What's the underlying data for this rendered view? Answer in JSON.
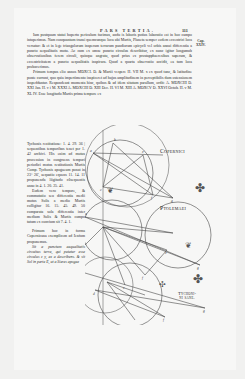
{
  "page": {
    "running_header": "PARS TERTIA.",
    "page_number": "111",
    "marginal_note": [
      "Cap.",
      "XXIV."
    ],
    "main_paragraphs": [
      "Iam postquam statui hupertu periculum facimus, andu is laboris potius laboratio est in hoc campo intuperimus. Nam conquantum transi quemcunque loca ubi Martis, Planeta semper eodem eccentrici loca versatur: & et in lege triangulorum insperam terrarum pandiorum epicycli vel orbis annui differentia a puncto aequalitatis motu. Ac cum ex omne puncto circulus describitur, ex nunc igitur longumub observationibus ferem circuli, quinque angratu, quod prius ex prostapphaeresibus superam, & eccentricitatem a puncto aequalitatis inspirara. Quod a quarta observatio accidit, ea tum loca probaverimus.",
      "Primum tempus elio annos MDXCI. D. & Martii vespere H. VII M. x ex quod tunc, & latitudine ponte currunt, quo quia impertimento inspiceret ad hujus amplitudinem in perceptibilis dum ostensionem inspeddantur. Respondeant momenta hinc, quibus & ad idem situtum parallum, ordit: A. MDXCIII D. XXI Jan. H. v i M. XXXI  A. MDXCIII D. XIII Dec. H. VI M. XIII  A. MDXCV D. XXVI Octob. H. v M. XL IV. Esse longitudo Martis prima tempore ex"
    ],
    "column_paragraphs": [
      "Tychonis restitutione: 1. 4. 29. 36 | sequentibus temporibus tenet per 1. 42 archivi. His enim ad motus procession in congruens tempori periodici motus restitutionis Martis Comp. Tychonis apogaeum ponat in 23° 26', aequatio equens 11. 14. 11 proponenda lõgitudo cŏsequentis anno in 4. 1. 20. 25. 41.",
      "Eodem vero tempore, & commutatio seu differentia medii motus Solis a medio Martis colligitur 16. 15. 45. 49. 50 comparata sola differentia inter medium Solis & Martis compu tatum ex convium sit 7. 4. 1.",
      "Primum hoc in forma Copernicana exemplicem ad Ienfum proponemus.",
      "Sit a punctum aequalitatis circuitus terra, qui putatur esse circulus z y, ex a describens. & sit Sol in parte E, ut a Sieres apogee"
    ]
  },
  "diagram": {
    "labels": {
      "copernicus": "Copernici",
      "ptolemy": "Ptolemaei",
      "tycho": [
        "Tychoni-",
        "ni sane."
      ]
    }
  },
  "colors": {
    "paper": "#f7f7f6",
    "ink": "#2a2a2a",
    "line": "#4a4a4a"
  }
}
